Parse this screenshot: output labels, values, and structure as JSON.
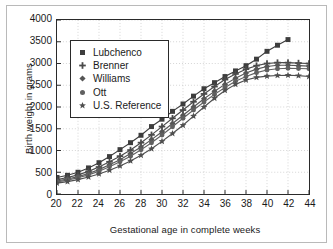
{
  "chart_data": {
    "type": "line",
    "title": "",
    "xlabel": "Gestational age in complete weeks",
    "ylabel": "Birth weight in grams",
    "xlim": [
      20,
      44
    ],
    "ylim": [
      0,
      4000
    ],
    "xticks": [
      20,
      22,
      24,
      26,
      28,
      30,
      32,
      34,
      36,
      38,
      40,
      42,
      44
    ],
    "yticks": [
      0,
      500,
      1000,
      1500,
      2000,
      2500,
      3000,
      3500,
      4000
    ],
    "xtick_labels": [
      "20",
      "22",
      "24",
      "26",
      "28",
      "30",
      "32",
      "34",
      "36",
      "38",
      "40",
      "42",
      "44"
    ],
    "ytick_labels": [
      "0",
      "500",
      "1000",
      "1500",
      "2000",
      "2500",
      "3000",
      "3500",
      "4000"
    ],
    "grid": true,
    "grid_style": "dotted",
    "legend_position": "upper-left-inside",
    "x": [
      20,
      21,
      22,
      23,
      24,
      25,
      26,
      27,
      28,
      29,
      30,
      31,
      32,
      33,
      34,
      35,
      36,
      37,
      38,
      39,
      40,
      41,
      42,
      43,
      44
    ],
    "series": [
      {
        "name": "Lubchenco",
        "marker": "square",
        "color": "#3d3d3d",
        "values": [
          380,
          430,
          500,
          600,
          720,
          860,
          1020,
          1180,
          1350,
          1550,
          1720,
          1900,
          2070,
          2250,
          2420,
          2560,
          2700,
          2830,
          2950,
          3100,
          3280,
          3420,
          3550,
          null,
          null
        ]
      },
      {
        "name": "Brenner",
        "marker": "plus",
        "color": "#4a4a4a",
        "values": [
          330,
          380,
          440,
          520,
          620,
          740,
          870,
          1010,
          1180,
          1360,
          1550,
          1740,
          1930,
          2120,
          2300,
          2470,
          2630,
          2760,
          2870,
          2950,
          3000,
          3020,
          3020,
          3010,
          3000
        ]
      },
      {
        "name": "Williams",
        "marker": "diamond",
        "color": "#555555",
        "values": [
          300,
          345,
          400,
          470,
          560,
          670,
          790,
          930,
          1080,
          1250,
          1430,
          1620,
          1810,
          2000,
          2190,
          2360,
          2520,
          2660,
          2780,
          2870,
          2930,
          2960,
          2960,
          2950,
          2940
        ]
      },
      {
        "name": "Ott",
        "marker": "circle",
        "color": "#606060",
        "values": [
          280,
          320,
          375,
          440,
          525,
          625,
          740,
          870,
          1015,
          1180,
          1355,
          1545,
          1740,
          1930,
          2115,
          2290,
          2450,
          2590,
          2700,
          2790,
          2850,
          2880,
          2890,
          2885,
          2880
        ]
      },
      {
        "name": "U.S. Reference",
        "marker": "star",
        "color": "#4f4f4f",
        "values": [
          250,
          285,
          330,
          390,
          460,
          545,
          645,
          760,
          890,
          1040,
          1210,
          1390,
          1580,
          1790,
          2000,
          2200,
          2380,
          2520,
          2620,
          2680,
          2710,
          2725,
          2730,
          2720,
          2700
        ]
      }
    ]
  },
  "legend": {
    "items": [
      {
        "label": "Lubchenco",
        "marker": "square-marker-icon"
      },
      {
        "label": "Brenner",
        "marker": "plus-marker-icon"
      },
      {
        "label": "Williams",
        "marker": "diamond-marker-icon"
      },
      {
        "label": "Ott",
        "marker": "circle-marker-icon"
      },
      {
        "label": "U.S. Reference",
        "marker": "star-marker-icon"
      }
    ]
  }
}
